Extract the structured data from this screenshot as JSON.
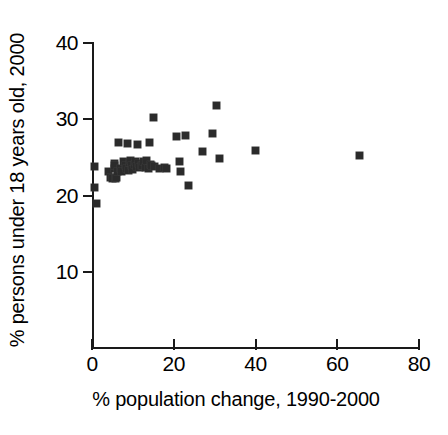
{
  "chart_data": {
    "type": "scatter",
    "title": "",
    "xlabel": "% population change, 1990-2000",
    "ylabel": "% persons under 18 years old, 2000",
    "xlim": [
      0,
      80
    ],
    "ylim": [
      0,
      40
    ],
    "xticks": [
      0,
      20,
      40,
      60,
      80
    ],
    "yticks": [
      10,
      20,
      30,
      40
    ],
    "xtick_labels": [
      "0",
      "20",
      "40",
      "60",
      "80"
    ],
    "ytick_labels": [
      "10",
      "20",
      "30",
      "40"
    ],
    "grid": false,
    "legend": null,
    "marker": "square",
    "marker_color": "#2b2b2b",
    "marker_size_px": 7,
    "n_points": 51,
    "points": [
      {
        "x": 0.5,
        "y": 23.8
      },
      {
        "x": 0.6,
        "y": 21.0
      },
      {
        "x": 1.2,
        "y": 18.9
      },
      {
        "x": 4.0,
        "y": 23.1
      },
      {
        "x": 4.6,
        "y": 22.3
      },
      {
        "x": 5.0,
        "y": 22.2
      },
      {
        "x": 5.4,
        "y": 23.5
      },
      {
        "x": 5.5,
        "y": 24.2
      },
      {
        "x": 5.6,
        "y": 23.9
      },
      {
        "x": 5.8,
        "y": 22.2
      },
      {
        "x": 6.0,
        "y": 22.4
      },
      {
        "x": 6.2,
        "y": 23.2
      },
      {
        "x": 6.4,
        "y": 26.9
      },
      {
        "x": 7.0,
        "y": 23.5
      },
      {
        "x": 7.3,
        "y": 23.2
      },
      {
        "x": 7.6,
        "y": 24.5
      },
      {
        "x": 8.2,
        "y": 24.0
      },
      {
        "x": 8.4,
        "y": 23.6
      },
      {
        "x": 8.6,
        "y": 26.8
      },
      {
        "x": 8.9,
        "y": 23.3
      },
      {
        "x": 9.1,
        "y": 24.3
      },
      {
        "x": 9.4,
        "y": 24.6
      },
      {
        "x": 9.7,
        "y": 24.0
      },
      {
        "x": 9.9,
        "y": 23.4
      },
      {
        "x": 10.3,
        "y": 24.1
      },
      {
        "x": 10.6,
        "y": 24.4
      },
      {
        "x": 10.8,
        "y": 23.8
      },
      {
        "x": 11.1,
        "y": 26.7
      },
      {
        "x": 11.4,
        "y": 24.2
      },
      {
        "x": 11.6,
        "y": 23.7
      },
      {
        "x": 12.0,
        "y": 24.0
      },
      {
        "x": 12.3,
        "y": 23.9
      },
      {
        "x": 12.7,
        "y": 24.4
      },
      {
        "x": 13.0,
        "y": 23.7
      },
      {
        "x": 13.4,
        "y": 24.6
      },
      {
        "x": 13.8,
        "y": 23.6
      },
      {
        "x": 14.1,
        "y": 26.9
      },
      {
        "x": 14.4,
        "y": 24.1
      },
      {
        "x": 14.6,
        "y": 23.9
      },
      {
        "x": 15.0,
        "y": 30.2
      },
      {
        "x": 15.3,
        "y": 23.8
      },
      {
        "x": 16.6,
        "y": 23.5
      },
      {
        "x": 17.8,
        "y": 23.7
      },
      {
        "x": 18.3,
        "y": 23.5
      },
      {
        "x": 20.6,
        "y": 27.7
      },
      {
        "x": 21.4,
        "y": 24.4
      },
      {
        "x": 21.7,
        "y": 23.2
      },
      {
        "x": 22.8,
        "y": 27.9
      },
      {
        "x": 23.6,
        "y": 21.3
      },
      {
        "x": 27.0,
        "y": 25.8
      },
      {
        "x": 29.6,
        "y": 28.1
      },
      {
        "x": 30.4,
        "y": 31.8
      },
      {
        "x": 31.2,
        "y": 24.8
      },
      {
        "x": 40.1,
        "y": 25.9
      },
      {
        "x": 65.5,
        "y": 25.3
      }
    ]
  },
  "axis": {
    "y_label_text": "% persons under 18 years old, 2000",
    "x_label_text": "% population change, 1990-2000"
  }
}
